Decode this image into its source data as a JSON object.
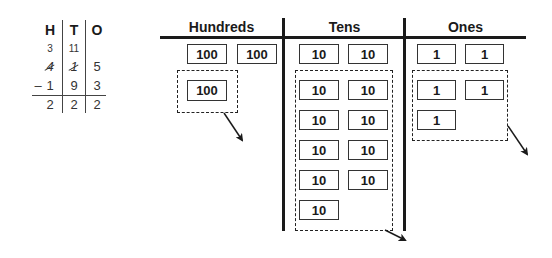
{
  "hto_table": {
    "headers": [
      "H",
      "T",
      "O"
    ],
    "carry_row": [
      "3",
      "11",
      ""
    ],
    "minuend_row": [
      "4",
      "1",
      "5"
    ],
    "minuend_struck": [
      true,
      true,
      false
    ],
    "operator": "–",
    "subtrahend_row": [
      "1",
      "9",
      "3"
    ],
    "result_row": [
      "2",
      "2",
      "2"
    ]
  },
  "place_value_chart": {
    "columns": [
      {
        "title": "Hundreds",
        "top_blocks": [
          "100",
          "100"
        ],
        "regrouped_blocks": [
          "100"
        ]
      },
      {
        "title": "Tens",
        "top_blocks": [
          "10",
          "10"
        ],
        "regrouped_blocks": [
          "10",
          "10",
          "10",
          "10",
          "10",
          "10",
          "10",
          "10",
          "10"
        ]
      },
      {
        "title": "Ones",
        "top_blocks": [
          "1",
          "1"
        ],
        "regrouped_blocks": [
          "1",
          "1",
          "1"
        ]
      }
    ]
  }
}
